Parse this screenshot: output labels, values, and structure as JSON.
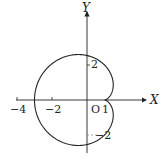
{
  "diagram": {
    "type": "parametric-curve",
    "axes": {
      "x_label": "X",
      "y_label": "Y",
      "origin_label": "O"
    },
    "x_ticks": [
      {
        "value": -4,
        "label": "−4"
      },
      {
        "value": -2,
        "label": "−2"
      },
      {
        "value": 1,
        "label": "1"
      }
    ],
    "y_ticks": [
      {
        "value": 2,
        "label": "2"
      },
      {
        "value": -2,
        "label": "−2"
      }
    ],
    "curve": {
      "x": "2cos t − cos 2t",
      "y": "2sin t − sin 2t",
      "cusp": [
        1,
        0
      ],
      "leftmost": [
        -3,
        0
      ]
    },
    "colors": {
      "line": "#222222",
      "background": "#ffffff"
    }
  }
}
